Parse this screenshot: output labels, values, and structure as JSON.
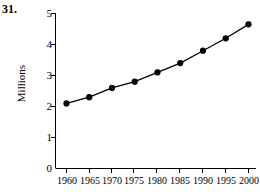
{
  "exercise": {
    "number": "31."
  },
  "chart_data": {
    "type": "line",
    "title": "",
    "xlabel": "",
    "ylabel": "Millions",
    "categories": [
      1960,
      1965,
      1970,
      1975,
      1980,
      1985,
      1990,
      1995,
      2000
    ],
    "x_tick_labels": [
      "1960",
      "1965",
      "1970",
      "1975",
      "1980",
      "1985",
      "1990",
      "1995",
      "2000"
    ],
    "values": [
      2.1,
      2.3,
      2.6,
      2.8,
      3.1,
      3.4,
      3.8,
      4.2,
      4.65
    ],
    "y_tick_labels": [
      "0",
      "1",
      "2",
      "3",
      "4",
      "5"
    ],
    "y_ticks": [
      0,
      1,
      2,
      3,
      4,
      5
    ],
    "xlim": [
      1960,
      2000
    ],
    "ylim": [
      0,
      5
    ],
    "grid": false,
    "legend": "none",
    "marker": "filled-circle",
    "line_color": "#000000",
    "marker_color": "#000000",
    "axis_color": "#000000"
  }
}
